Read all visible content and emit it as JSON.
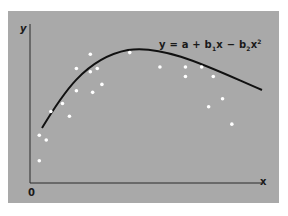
{
  "chart_data": {
    "type": "scatter",
    "title": "",
    "xlabel": "x",
    "ylabel": "y",
    "origin_label": "0",
    "annotation": "y = a + b1x − b2x²",
    "grid": false,
    "legend": null,
    "xlim": [
      0,
      1
    ],
    "ylim": [
      0,
      1
    ],
    "series": [
      {
        "name": "observations",
        "kind": "scatter",
        "color": "#ffffff",
        "points": [
          [
            0.04,
            0.14
          ],
          [
            0.04,
            0.3
          ],
          [
            0.07,
            0.27
          ],
          [
            0.09,
            0.45
          ],
          [
            0.14,
            0.5
          ],
          [
            0.17,
            0.42
          ],
          [
            0.2,
            0.58
          ],
          [
            0.27,
            0.57
          ],
          [
            0.2,
            0.72
          ],
          [
            0.26,
            0.7
          ],
          [
            0.31,
            0.62
          ],
          [
            0.29,
            0.72
          ],
          [
            0.26,
            0.81
          ],
          [
            0.43,
            0.82
          ],
          [
            0.56,
            0.73
          ],
          [
            0.67,
            0.73
          ],
          [
            0.74,
            0.73
          ],
          [
            0.67,
            0.67
          ],
          [
            0.79,
            0.67
          ],
          [
            0.83,
            0.53
          ],
          [
            0.77,
            0.48
          ],
          [
            0.87,
            0.37
          ]
        ]
      },
      {
        "name": "fitted quadratic y = a + b1x − b2x²",
        "kind": "line",
        "color": "#111111",
        "points": [
          [
            0.05,
            0.34
          ],
          [
            0.15,
            0.55
          ],
          [
            0.25,
            0.7
          ],
          [
            0.35,
            0.77
          ],
          [
            0.45,
            0.78
          ],
          [
            0.55,
            0.75
          ],
          [
            0.65,
            0.7
          ],
          [
            0.75,
            0.63
          ],
          [
            0.85,
            0.56
          ],
          [
            0.95,
            0.48
          ]
        ]
      }
    ]
  },
  "labels": {
    "y_axis": "y",
    "x_axis": "x",
    "origin": "0",
    "eq_y": "y",
    "eq_eq": " = ",
    "eq_a": "a",
    "eq_plus": " + ",
    "eq_b1": "b",
    "eq_b1_sub": "1",
    "eq_x1": "x",
    "eq_minus": " − ",
    "eq_b2": "b",
    "eq_b2_sub": "2",
    "eq_x2": "x",
    "eq_x2_sup": "2"
  },
  "colors": {
    "panel": "#a9a9a9",
    "axis": "#2b2b2b",
    "curve": "#111111",
    "points": "#ffffff"
  }
}
